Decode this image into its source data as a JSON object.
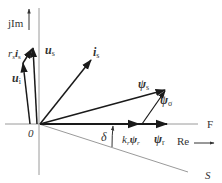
{
  "diagram": {
    "axes": {
      "imag_label": "jIm",
      "real_label": "Re",
      "origin_label": "0",
      "line_F_label": "F",
      "line_S_label": "S"
    },
    "vectors": {
      "us": "u",
      "us_sub": "s",
      "is": "i",
      "is_sub": "s",
      "ui": "u",
      "ui_sub": "i",
      "rsis_r": "r",
      "rsis_r_sub": "s",
      "rsis_i": "i",
      "rsis_i_sub": "s",
      "psis": "ψ",
      "psis_sub": "s",
      "psisigma": "ψ",
      "psisigma_sub": "σ",
      "psir": "ψ",
      "psir_sub": "r",
      "krpsir_k": "k",
      "krpsir_k_sub": "r",
      "krpsir_psi": "ψ",
      "krpsir_psi_sub": "r"
    },
    "angle_label": "δ",
    "colors": {
      "vector": "#222222",
      "axis": "#9a9a9a",
      "text": "#333333"
    }
  }
}
